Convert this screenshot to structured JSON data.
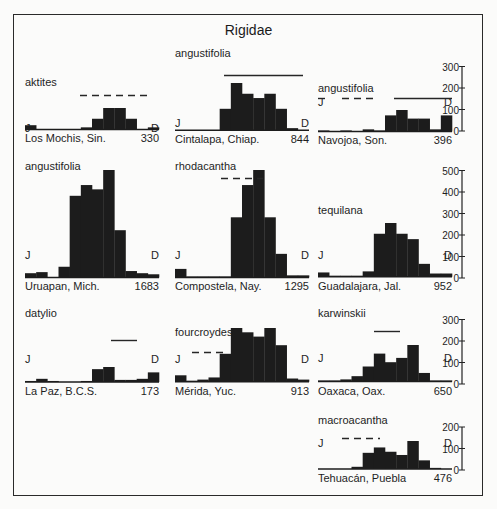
{
  "figure": {
    "title": "Rigidae",
    "month_start_label": "J",
    "month_end_label": "D"
  },
  "colors": {
    "bar": "#1c1c1c",
    "line": "#262626",
    "text": "#1e1e1e",
    "background": "#fbfbfa"
  },
  "panels": [
    {
      "species": "aktites",
      "location": "Los Mochis, Sin.",
      "n": "330"
    },
    {
      "species": "angustifolia",
      "location": "Cintalapa, Chiap.",
      "n": "844"
    },
    {
      "species": "angustifolia",
      "location": "Navojoa, Son.",
      "n": "396"
    },
    {
      "species": "angustifolia",
      "location": "Uruapan, Mich.",
      "n": "1683"
    },
    {
      "species": "rhodacantha",
      "location": "Compostela, Nay.",
      "n": "1295"
    },
    {
      "species": "tequilana",
      "location": "Guadalajara, Jal.",
      "n": "952"
    },
    {
      "species": "datylio",
      "location": "La Paz, B.C.S.",
      "n": "173"
    },
    {
      "species": "fourcroydes",
      "location": "Mérida, Yuc.",
      "n": "913"
    },
    {
      "species": "karwinskii",
      "location": "Oaxaca, Oax.",
      "n": "650"
    },
    {
      "species": "macroacantha",
      "location": "Tehuacán, Puebla",
      "n": "476"
    }
  ],
  "axes": [
    {
      "row": 1,
      "ticks": [
        "300",
        "200",
        "100",
        "0"
      ]
    },
    {
      "row": 2,
      "ticks": [
        "500",
        "400",
        "300",
        "200",
        "100",
        "0"
      ]
    },
    {
      "row": 3,
      "ticks": [
        "300",
        "200",
        "100",
        "0"
      ]
    },
    {
      "row": 4,
      "ticks": [
        "200",
        "100",
        "0"
      ]
    }
  ],
  "chart_data": {
    "type": "bar",
    "title": "Rigidae",
    "xlabel": "Month (J–D)",
    "ylabel": "Count",
    "categories": [
      "J",
      "F",
      "M",
      "A",
      "M",
      "J",
      "J",
      "A",
      "S",
      "O",
      "N",
      "D"
    ],
    "grid": false,
    "legend": "none",
    "series": [
      {
        "name": "aktites — Los Mochis, Sin.",
        "n": 330,
        "values": [
          20,
          0,
          0,
          0,
          0,
          10,
          50,
          100,
          100,
          50,
          0,
          10
        ],
        "bloom_bar": "dashed, months 6–10"
      },
      {
        "name": "angustifolia — Cintalapa, Chiap.",
        "n": 844,
        "values": [
          0,
          0,
          0,
          0,
          100,
          220,
          170,
          150,
          170,
          100,
          10,
          0
        ],
        "bloom_bar": "solid, months 5–12"
      },
      {
        "name": "angustifolia — Navojoa, Son.",
        "n": 396,
        "values": [
          5,
          0,
          5,
          0,
          10,
          5,
          75,
          100,
          60,
          60,
          10,
          75
        ],
        "bloom_bar": "dashed J–Apr, solid May–D"
      },
      {
        "name": "angustifolia — Uruapan, Mich.",
        "n": 1683,
        "values": [
          20,
          25,
          0,
          50,
          380,
          430,
          410,
          500,
          220,
          30,
          20,
          15
        ],
        "bloom_bar": "none"
      },
      {
        "name": "rhodacantha — Compostela, Nay.",
        "n": 1295,
        "values": [
          40,
          5,
          5,
          5,
          5,
          280,
          430,
          500,
          280,
          110,
          10,
          10
        ],
        "bloom_bar": "dashed, months 5–8"
      },
      {
        "name": "tequilana — Guadalajara, Jal.",
        "n": 952,
        "values": [
          20,
          5,
          5,
          5,
          25,
          200,
          250,
          200,
          175,
          60,
          15,
          15
        ],
        "bloom_bar": "none"
      },
      {
        "name": "datylio — La Paz, B.C.S.",
        "n": 173,
        "values": [
          5,
          15,
          5,
          0,
          0,
          5,
          60,
          70,
          10,
          10,
          15,
          45
        ],
        "bloom_bar": "solid, months 8–10"
      },
      {
        "name": "fourcroydes — Mérida, Yuc.",
        "n": 913,
        "values": [
          30,
          5,
          10,
          20,
          130,
          250,
          230,
          210,
          250,
          170,
          15,
          10
        ],
        "bloom_bar": "dashed, months 2–5"
      },
      {
        "name": "karwinskii — Oaxaca, Oax.",
        "n": 650,
        "values": [
          5,
          5,
          10,
          25,
          70,
          130,
          90,
          110,
          170,
          40,
          5,
          5
        ],
        "bloom_bar": "solid, months 6–8"
      },
      {
        "name": "macroacantha — Tehuacán, Puebla",
        "n": 476,
        "values": [
          0,
          0,
          0,
          10,
          75,
          100,
          80,
          65,
          130,
          40,
          5,
          0
        ],
        "bloom_bar": "dashed, months 3–6"
      }
    ],
    "ylim_per_row": [
      [
        0,
        300
      ],
      [
        0,
        500
      ],
      [
        0,
        300
      ],
      [
        0,
        200
      ]
    ]
  }
}
